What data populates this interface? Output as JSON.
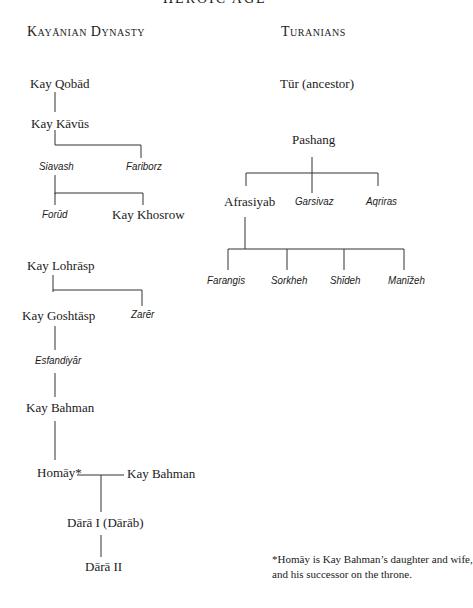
{
  "page_title": "HEROIC AGE",
  "left_tree": {
    "heading": "Kayānian Dynasty",
    "members": {
      "kay_qobad": "Kay Qobād",
      "kay_kavus": "Kay Kāvūs",
      "siavash": "Siavash",
      "fariborz": "Fariborz",
      "forud": "Forūd",
      "kay_khosrow": "Kay Khosrow",
      "kay_lohrasp": "Kay Lohrāsp",
      "kay_goshtasp": "Kay Goshtāsp",
      "zarer": "Zarēr",
      "esfandiyar": "Esfandiyār",
      "kay_bahman": "Kay Bahman",
      "homay": "Homāy*",
      "kay_bahman_2": "Kay Bahman",
      "dara_1": "Dārā I (Dārāb)",
      "dara_2": "Dārā II"
    }
  },
  "right_tree": {
    "heading": "Turanians",
    "members": {
      "tur": "Tūr (ancestor)",
      "pashang": "Pashang",
      "afrasiyab": "Afrasiyab",
      "garsivaz": "Garsivaz",
      "aqriras": "Aqriras",
      "farangis": "Farangis",
      "sorkheh": "Sorkheh",
      "shideh": "Shīdeh",
      "manizheh": "Manīžeh"
    }
  },
  "footnote": {
    "line1": "*Homāy is Kay Bahman’s daughter and wife,",
    "line2": "and his successor on the throne."
  }
}
